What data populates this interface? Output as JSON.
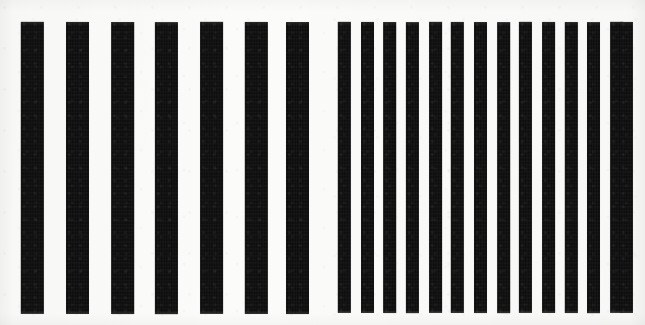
{
  "image": {
    "title": "Vertical bar stripe pattern",
    "kind": "scanned-line-pattern",
    "width": 645,
    "height": 325,
    "background_color": "#fbfbfa",
    "bar_color": "#0d0d0d",
    "alt_text": "Two blocks of vertical black bars on white: seven wide bars on the left and fourteen narrower bars on the right"
  },
  "chart_data": {
    "type": "bar",
    "xlabel": "",
    "ylabel": "",
    "grid": false,
    "legend": "none",
    "xlim": [
      0,
      645
    ],
    "ylim": [
      0,
      325
    ],
    "groups": [
      {
        "name": "left-coarse-group",
        "bar_count": 7,
        "bar_width": 23,
        "bar_period": 44.8,
        "gap_width": 21.8,
        "top": 22,
        "bottom": 314,
        "bar_height": 292,
        "x_start": 21,
        "x_end": 309,
        "bar_x_positions": [
          21,
          66,
          111,
          155,
          200,
          245,
          286
        ]
      },
      {
        "name": "right-fine-group",
        "bar_count": 14,
        "bar_width": 13,
        "bar_period": 22.7,
        "gap_width": 9.7,
        "top": 22,
        "bottom": 313,
        "bar_height": 291,
        "x_start": 338,
        "x_end": 633,
        "bar_x_positions": [
          338,
          361,
          383,
          406,
          429,
          451,
          474,
          497,
          519,
          542,
          565,
          587,
          610,
          620
        ]
      }
    ],
    "center_gap": {
      "from": 309,
      "to": 338,
      "width": 29
    }
  }
}
